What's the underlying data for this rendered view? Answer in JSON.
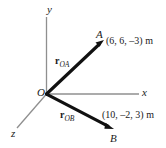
{
  "figure": {
    "kind": "3d-position-vector-diagram",
    "axes": {
      "x_label": "x",
      "y_label": "y",
      "z_label": "z",
      "origin_label": "O"
    },
    "points": [
      {
        "id": "A",
        "label": "A",
        "coordinates_text": "(6, 6, –3) m",
        "coordinates": [
          6,
          6,
          -3
        ],
        "units": "m"
      },
      {
        "id": "B",
        "label": "B",
        "coordinates_text": "(10, –2, 3) m",
        "coordinates": [
          10,
          -2,
          3
        ],
        "units": "m"
      }
    ],
    "vectors": [
      {
        "id": "rOA",
        "base": "r",
        "subscript": "OA",
        "from": "O",
        "to": "A"
      },
      {
        "id": "rOB",
        "base": "r",
        "subscript": "OB",
        "from": "O",
        "to": "B"
      }
    ],
    "colors": {
      "axis": "#8f8f8f",
      "vector": "#111111",
      "text": "#1a1a1a",
      "background": "#ffffff"
    }
  }
}
